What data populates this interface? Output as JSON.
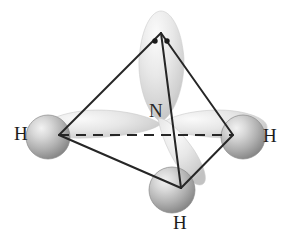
{
  "figure": {
    "molecule": "NH3",
    "background_color": "#ffffff",
    "line_color": "#262626",
    "sphere_color": "#a9a9a9",
    "lobe_color": "#d9d9d9"
  },
  "labels": {
    "central_atom": "N",
    "hydrogen_left": "H",
    "hydrogen_right": "H",
    "hydrogen_bottom": "H"
  },
  "lone_pair": {
    "dot_count": 2,
    "dot_color": "#1a1a1a"
  },
  "geometry": {
    "center": {
      "x": 161,
      "y": 122
    },
    "apex": {
      "x": 161,
      "y": 33
    },
    "vertex_left": {
      "x": 59,
      "y": 135
    },
    "vertex_right": {
      "x": 233,
      "y": 135
    },
    "vertex_bottom": {
      "x": 181,
      "y": 188
    },
    "dashed_line": {
      "x1": 59,
      "y1": 135,
      "x2": 233,
      "y2": 135
    }
  },
  "atoms": [
    {
      "name": "hydrogen-left",
      "cx": 48,
      "cy": 137,
      "r": 22
    },
    {
      "name": "hydrogen-right",
      "cx": 243,
      "cy": 137,
      "r": 22
    },
    {
      "name": "hydrogen-bottom",
      "cx": 172,
      "cy": 190,
      "r": 23
    }
  ],
  "orbitals": [
    {
      "name": "lobe-up",
      "direction": "up"
    },
    {
      "name": "lobe-left",
      "direction": "left"
    },
    {
      "name": "lobe-right",
      "direction": "right"
    },
    {
      "name": "lobe-down-right",
      "direction": "down-right"
    }
  ]
}
